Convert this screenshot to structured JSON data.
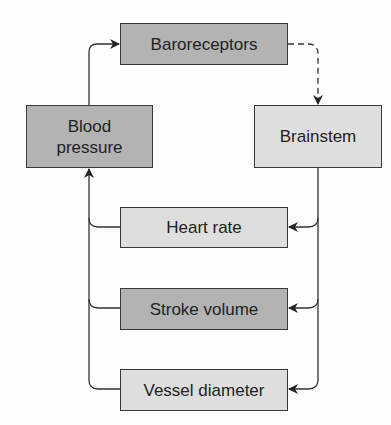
{
  "diagram": {
    "nodes": {
      "baroreceptors": "Baroreceptors",
      "blood_pressure": "Blood pressure",
      "brainstem": "Brainstem",
      "heart_rate": "Heart rate",
      "stroke_volume": "Stroke volume",
      "vessel_diameter": "Vessel diameter"
    },
    "edges": [
      {
        "from": "Blood pressure",
        "to": "Baroreceptors",
        "style": "solid"
      },
      {
        "from": "Baroreceptors",
        "to": "Brainstem",
        "style": "dashed"
      },
      {
        "from": "Brainstem",
        "to": "Heart rate",
        "style": "solid"
      },
      {
        "from": "Brainstem",
        "to": "Stroke volume",
        "style": "solid"
      },
      {
        "from": "Brainstem",
        "to": "Vessel diameter",
        "style": "solid"
      },
      {
        "from": "Heart rate",
        "to": "Blood pressure",
        "style": "solid"
      },
      {
        "from": "Stroke volume",
        "to": "Blood pressure",
        "style": "solid"
      },
      {
        "from": "Vessel diameter",
        "to": "Blood pressure",
        "style": "solid"
      }
    ],
    "colors": {
      "dark_fill": "#b3b3b3",
      "light_fill": "#dedede",
      "stroke": "#3a3a3a"
    }
  }
}
